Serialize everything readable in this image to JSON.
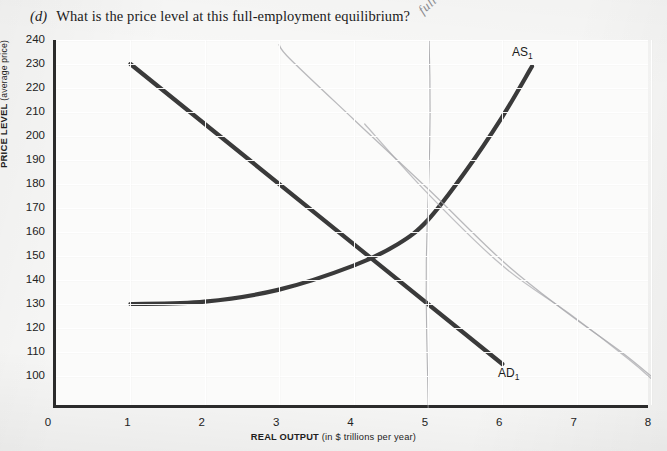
{
  "question": {
    "label": "(d)",
    "text": "What is the price level at this full-employment equilibrium?"
  },
  "annotation": {
    "handwritten_note": "full employment"
  },
  "chart_data": {
    "type": "line",
    "title": "",
    "xlabel_bold": "REAL OUTPUT",
    "xlabel_sub": "(in $ trillions per year)",
    "ylabel_bold": "PRICE LEVEL",
    "ylabel_sub": "(average price)",
    "xlim": [
      0,
      8
    ],
    "ylim": [
      95,
      245
    ],
    "grid": true,
    "legend": "inline-labels",
    "x_ticks": [
      "0",
      "1",
      "2",
      "3",
      "4",
      "5",
      "6",
      "7",
      "8"
    ],
    "y_ticks": [
      "100",
      "110",
      "120",
      "130",
      "140",
      "150",
      "160",
      "170",
      "180",
      "190",
      "200",
      "210",
      "220",
      "230",
      "240"
    ],
    "series": [
      {
        "name": "AD1",
        "label": "AD",
        "subscript": "1",
        "kind": "printed-line",
        "color": "#3a3a3a",
        "points": [
          [
            1,
            230
          ],
          [
            6,
            105
          ]
        ]
      },
      {
        "name": "AS1",
        "label": "AS",
        "subscript": "1",
        "kind": "printed-curve",
        "color": "#3a3a3a",
        "points": [
          [
            1,
            130
          ],
          [
            2,
            131
          ],
          [
            3,
            136
          ],
          [
            4,
            146
          ],
          [
            4.6,
            155
          ],
          [
            5,
            165
          ],
          [
            5.5,
            185
          ],
          [
            6,
            208
          ],
          [
            6.4,
            229
          ]
        ]
      },
      {
        "name": "full-employment-line",
        "label": "full employment",
        "kind": "pencil-vertical",
        "color": "#9a9a9e",
        "x": 5
      },
      {
        "name": "AD2-pencil",
        "kind": "pencil-line",
        "color": "#a0a0a4",
        "points": [
          [
            3,
            238
          ],
          [
            3.15,
            232
          ],
          [
            4,
            207
          ],
          [
            5,
            178
          ],
          [
            6,
            148
          ],
          [
            6.8,
            128
          ],
          [
            7.6,
            110
          ],
          [
            8,
            100
          ]
        ]
      },
      {
        "name": "AD3-pencil",
        "kind": "pencil-line",
        "color": "#a8a8ac",
        "points": [
          [
            4.15,
            205
          ],
          [
            5,
            176
          ],
          [
            6,
            146
          ],
          [
            6.9,
            126
          ],
          [
            7.7,
            107
          ],
          [
            8,
            99
          ]
        ]
      }
    ],
    "equilibrium_printed": {
      "x": 4,
      "price": 153
    },
    "equilibrium_full_employment": {
      "x": 5,
      "price": 178
    }
  }
}
